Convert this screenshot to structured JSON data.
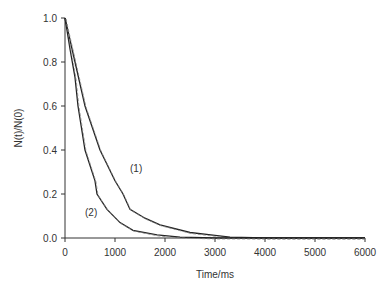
{
  "chart_data": {
    "type": "line",
    "title": "",
    "xlabel": "Time/ms",
    "ylabel": "N(t)/N(0)",
    "xlim": [
      0,
      6000
    ],
    "ylim": [
      0.0,
      1.0
    ],
    "x_ticks": [
      "0",
      "1000",
      "2000",
      "3000",
      "4000",
      "5000",
      "6000"
    ],
    "y_ticks": [
      "0.0",
      "0.2",
      "0.4",
      "0.6",
      "0.8",
      "1.0"
    ],
    "grid": false,
    "legend": "none (curves annotated inline)",
    "annotations": [
      {
        "text": "(1)",
        "x": 1300,
        "y": 0.3
      },
      {
        "text": "(2)",
        "x": 400,
        "y": 0.1
      }
    ],
    "series": [
      {
        "name": "(1)",
        "x": [
          0,
          100,
          200,
          400,
          700,
          1000,
          1160,
          1300,
          1600,
          1900,
          2500,
          3000,
          3300,
          4000,
          6000
        ],
        "values": [
          1.0,
          0.9,
          0.8,
          0.6,
          0.4,
          0.26,
          0.2,
          0.13,
          0.09,
          0.06,
          0.025,
          0.012,
          0.004,
          0.0,
          0.0
        ]
      },
      {
        "name": "(2)",
        "x": [
          0,
          100,
          200,
          260,
          400,
          600,
          640,
          840,
          1100,
          1360,
          1840,
          2300,
          3000,
          6000
        ],
        "values": [
          1.0,
          0.86,
          0.73,
          0.6,
          0.4,
          0.26,
          0.2,
          0.13,
          0.07,
          0.035,
          0.014,
          0.004,
          0.0,
          0.0
        ]
      }
    ]
  },
  "caption": "(cropped caption text, illegible)"
}
